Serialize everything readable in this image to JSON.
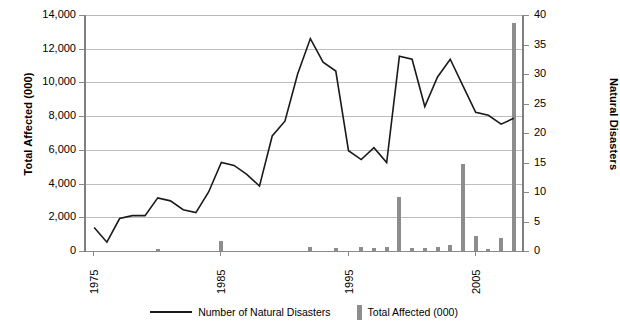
{
  "chart_data": {
    "type": "line",
    "title": "",
    "xlabel": "",
    "ylabel": "Total Affected (000)",
    "y2label": "Natural Disasters",
    "grid": true,
    "legend_position": "bottom",
    "x": [
      1975,
      1976,
      1977,
      1978,
      1979,
      1980,
      1981,
      1982,
      1983,
      1984,
      1985,
      1986,
      1987,
      1988,
      1989,
      1990,
      1991,
      1992,
      1993,
      1994,
      1995,
      1996,
      1997,
      1998,
      1999,
      2000,
      2001,
      2002,
      2003,
      2004,
      2005,
      2006,
      2007,
      2008
    ],
    "xticks": [
      1975,
      1985,
      1995,
      2005
    ],
    "ylim": [
      0,
      14000
    ],
    "yticks": [
      0,
      2000,
      4000,
      6000,
      8000,
      10000,
      12000,
      14000
    ],
    "yticklabels": [
      "0",
      "2,000",
      "4,000",
      "6,000",
      "8,000",
      "10,000",
      "12,000",
      "14,000"
    ],
    "y2lim": [
      0,
      40
    ],
    "y2ticks": [
      0,
      5,
      10,
      15,
      20,
      25,
      30,
      35,
      40
    ],
    "y2ticklabels": [
      "0",
      "5",
      "10",
      "15",
      "20",
      "25",
      "30",
      "35",
      "40"
    ],
    "series": [
      {
        "name": "Number of Natural Disasters",
        "type": "line",
        "axis": "right",
        "color": "#1a1a1a",
        "values": [
          4.0,
          1.5,
          5.5,
          6.0,
          6.0,
          9.0,
          8.5,
          7.0,
          6.5,
          10.0,
          15.0,
          14.5,
          13.0,
          11.0,
          19.5,
          22.0,
          30.0,
          36.0,
          32.0,
          30.5,
          17.0,
          15.5,
          17.5,
          15.0,
          33.0,
          32.5,
          24.5,
          29.5,
          32.5,
          28.0,
          23.5,
          23.0,
          21.5,
          22.5
        ]
      },
      {
        "name": "Total Affected (000)",
        "type": "bar",
        "axis": "left",
        "color": "#8d8d8d",
        "values": [
          0,
          0,
          0,
          0,
          0,
          100,
          0,
          0,
          0,
          0,
          600,
          0,
          0,
          0,
          0,
          0,
          0,
          250,
          0,
          200,
          0,
          250,
          200,
          250,
          3200,
          150,
          200,
          250,
          350,
          5150,
          900,
          100,
          750,
          13500
        ]
      }
    ]
  },
  "axes": {
    "left_title": "Total Affected (000)",
    "right_title": "Natural Disasters"
  },
  "legend": {
    "items": [
      {
        "label": "Number of Natural Disasters",
        "marker": "line"
      },
      {
        "label": "Total Affected (000)",
        "marker": "bar"
      }
    ]
  },
  "colors": {
    "line": "#1a1a1a",
    "bar": "#8d8d8d",
    "grid": "#bdbdbd",
    "axis": "#808080",
    "text": "#000000"
  }
}
